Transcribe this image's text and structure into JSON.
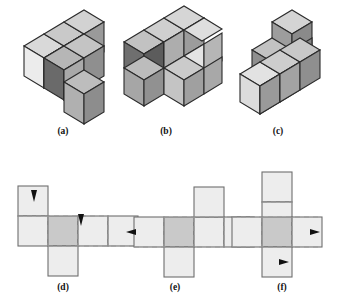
{
  "figure": {
    "caption_labels": [
      "(a)",
      "(b)",
      "(c)",
      "(d)",
      "(e)",
      "(f)"
    ],
    "top_row_title": "isometric cube assemblies",
    "bottom_row_title": "cube nets with fold arrows",
    "palette": {
      "cube_top_light": "#d8d8d8",
      "cube_top_mid": "#bfbfbf",
      "cube_face_white": "#ececec",
      "cube_face_light": "#cfcfcf",
      "cube_face_mid": "#a8a8a8",
      "cube_face_dark": "#7c7c7c",
      "cube_face_darkest": "#5e5e5e",
      "outline": "#2b2b2b",
      "net_fill": "#ededed",
      "net_center_fill": "#c9c9c9",
      "net_outline": "#6e6e6e",
      "dash_color": "#9a9a9a",
      "arrow_color": "#111111",
      "background": "#ffffff"
    },
    "panels": [
      {
        "id": "a",
        "label": "(a)",
        "label_x": 63,
        "label_y": 131,
        "type": "isometric-cube-assembly",
        "cube_count": 6,
        "description": "L-shaped arrangement: row of three cubes going back-right, two cubes forward, one cube dropping down at the right front"
      },
      {
        "id": "b",
        "label": "(b)",
        "label_x": 166,
        "label_y": 131,
        "type": "isometric-cube-assembly",
        "cube_count": 6,
        "description": "U-shaped arrangement: upper row of three cubes with two lower cubes at the ends leaving a notch"
      },
      {
        "id": "c",
        "label": "(c)",
        "label_x": 278,
        "label_y": 131,
        "type": "isometric-cube-assembly",
        "cube_count": 6,
        "description": "L-shaped vertical arrangement: bottom row of three cubes with two cubes stacked upward at the back right"
      },
      {
        "id": "d",
        "label": "(d)",
        "label_x": 63,
        "label_y": 287,
        "type": "cube-net",
        "arrows": [
          {
            "direction": "up",
            "x": 34,
            "y": 190
          },
          {
            "direction": "up",
            "x": 81,
            "y": 215
          }
        ],
        "description": "Net: horizontal band of three squares, one square above the left cell, one square below the centre cell"
      },
      {
        "id": "e",
        "label": "(e)",
        "label_x": 175,
        "label_y": 287,
        "type": "cube-net",
        "arrows": [
          {
            "direction": "left",
            "x": 141,
            "y": 232
          },
          {
            "direction": "right",
            "x": 232,
            "y": 232
          }
        ],
        "description": "Net: horizontal band of three squares, one square above the right-centre cell, one square below the left-centre cell"
      },
      {
        "id": "f",
        "label": "(f)",
        "label_x": 282,
        "label_y": 287,
        "type": "cube-net",
        "arrows": [
          {
            "direction": "right",
            "x": 319,
            "y": 232
          },
          {
            "direction": "right",
            "x": 297,
            "y": 262
          }
        ],
        "description": "Net: vertical band of three squares through the centre, one square to the left and one to the right of the centre cell"
      }
    ]
  }
}
